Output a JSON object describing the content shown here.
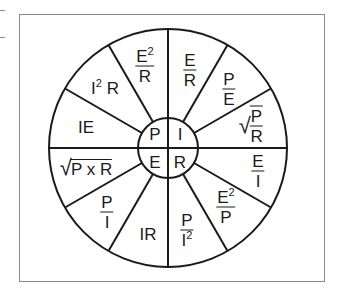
{
  "diagram": {
    "title": "",
    "center_quadrants": {
      "top_left": "P",
      "top_right": "I",
      "bottom_left": "E",
      "bottom_right": "R"
    },
    "segments": {
      "P": {
        "formulas": [
          {
            "id": "e2_over_r",
            "num": "E",
            "num_sup": "2",
            "den": "R"
          },
          {
            "id": "i2r",
            "base": "I",
            "sup": "2",
            "rest": "R"
          },
          {
            "id": "ie",
            "text": "IE"
          }
        ]
      },
      "I": {
        "formulas": [
          {
            "id": "e_over_r",
            "num": "E",
            "den": "R"
          },
          {
            "id": "p_over_e",
            "num": "P",
            "den": "E"
          },
          {
            "id": "sqrt_p_over_r",
            "num": "P",
            "den": "R"
          }
        ]
      },
      "R": {
        "formulas": [
          {
            "id": "e_over_i",
            "num": "E",
            "den": "I"
          },
          {
            "id": "e2_over_p",
            "num": "E",
            "num_sup": "2",
            "den": "P"
          },
          {
            "id": "p_over_i2",
            "num": "P",
            "den": "I",
            "den_sup": "2"
          }
        ]
      },
      "E": {
        "formulas": [
          {
            "id": "ir",
            "text": "IR"
          },
          {
            "id": "p_over_i",
            "num": "P",
            "den": "I"
          },
          {
            "id": "sqrt_pxr",
            "text": "P x R"
          }
        ]
      }
    },
    "colors": {
      "line": "#1a1a1a",
      "frame": "#8a8a8a",
      "background": "#ffffff"
    }
  }
}
